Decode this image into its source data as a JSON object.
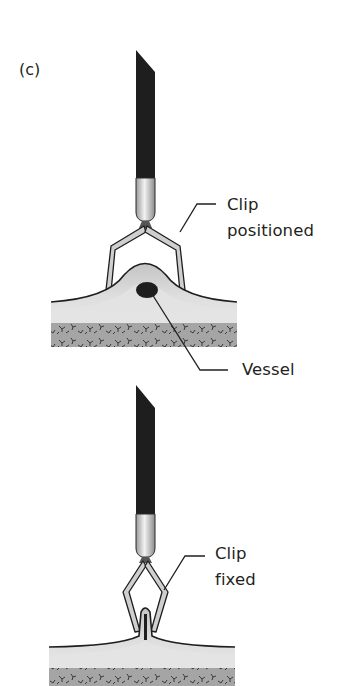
{
  "figure": {
    "panel_label": "(c)",
    "colors": {
      "instrument_shaft": "#1e1e1e",
      "instrument_tip": "#cfcfcf",
      "clip_fill": "#c8c8c8",
      "tissue_outline": "#1e1e1e",
      "mucosa_dark": "#bdbdbd",
      "mucosa_light": "#e2e2e2",
      "submucosa": "#a3a3a3",
      "vessel": "#1e1e1e",
      "text": "#231f20"
    },
    "stage_1": {
      "clip_label_line1": "Clip",
      "clip_label_line2": "positioned",
      "vessel_label": "Vessel"
    },
    "stage_2": {
      "clip_label_line1": "Clip",
      "clip_label_line2": "fixed"
    }
  }
}
